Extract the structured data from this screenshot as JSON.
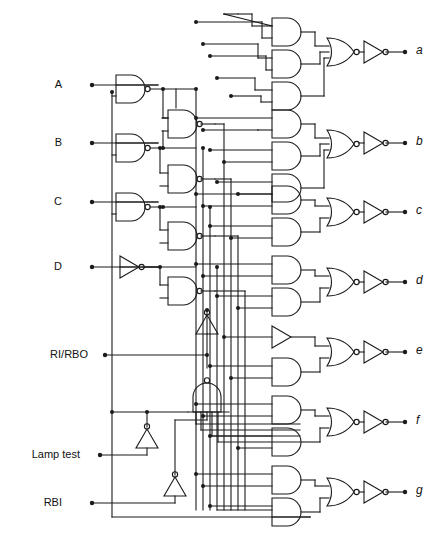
{
  "diagram": {
    "type": "logic-circuit-schematic",
    "canvas": {
      "width": 440,
      "height": 539
    },
    "style": {
      "background": "#ffffff",
      "line_color": "#1a1a1a",
      "line_width": 1.1,
      "bubble_radius": 2.6,
      "junction_radius": 2.0,
      "terminal_radius": 2.2
    },
    "inputs": [
      {
        "name": "input-a",
        "label": "A",
        "x": 62,
        "y": 85,
        "dot_x": 92
      },
      {
        "name": "input-b",
        "label": "B",
        "x": 62,
        "y": 143,
        "dot_x": 92
      },
      {
        "name": "input-c",
        "label": "C",
        "x": 62,
        "y": 202,
        "dot_x": 92
      },
      {
        "name": "input-d",
        "label": "D",
        "x": 62,
        "y": 267,
        "dot_x": 92
      },
      {
        "name": "input-ri-rbo",
        "label": "RI/RBO",
        "x": 88,
        "y": 355,
        "dot_x": 105
      },
      {
        "name": "input-lamp-test",
        "label": "Lamp test",
        "x": 80,
        "y": 455,
        "dot_x": 100
      },
      {
        "name": "input-rbi",
        "label": "RBI",
        "x": 62,
        "y": 503,
        "dot_x": 92
      }
    ],
    "outputs": [
      {
        "name": "output-a",
        "label": "a",
        "x": 418,
        "y": 52,
        "dot_x": 405
      },
      {
        "name": "output-b",
        "label": "b",
        "x": 418,
        "y": 143,
        "dot_x": 405
      },
      {
        "name": "output-c",
        "label": "c",
        "x": 418,
        "y": 212,
        "dot_x": 405
      },
      {
        "name": "output-d",
        "label": "d",
        "x": 418,
        "y": 282,
        "dot_x": 405
      },
      {
        "name": "output-e",
        "label": "e",
        "x": 418,
        "y": 352,
        "dot_x": 405
      },
      {
        "name": "output-f",
        "label": "f",
        "x": 418,
        "y": 422,
        "dot_x": 405
      },
      {
        "name": "output-g",
        "label": "g",
        "x": 418,
        "y": 492,
        "dot_x": 405
      }
    ],
    "gate_counts": {
      "input_nand_gates": 7,
      "and_gates": 17,
      "nor_gates": 7,
      "output_inverters": 7,
      "control_inverters": 3,
      "control_nand_gates": 1,
      "buffers": 1
    }
  }
}
